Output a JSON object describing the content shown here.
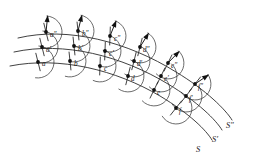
{
  "figure": {
    "background_color": "#ffffff",
    "ink_color": "#1c1c1c",
    "width": 256,
    "height": 160
  },
  "wavefronts": [
    {
      "id": "S",
      "label": "S",
      "label_pos": {
        "x": 196,
        "y": 152
      },
      "role": "primary-wavefront",
      "path": "M 10,66 C 60,56 116,70 160,96 C 190,114 206,130 212,140",
      "points": [
        {
          "label": "a",
          "x": 38,
          "y": 62,
          "lx": 42,
          "ly": 66,
          "tick_angle": 104,
          "arrow_angle": 6
        },
        {
          "label": "b",
          "x": 70,
          "y": 61,
          "lx": 74,
          "ly": 66,
          "tick_angle": 96,
          "arrow_angle": 14
        },
        {
          "label": "c",
          "x": 100,
          "y": 66,
          "lx": 104,
          "ly": 71,
          "tick_angle": 88,
          "arrow_angle": 22
        },
        {
          "label": "d",
          "x": 128,
          "y": 76,
          "lx": 131,
          "ly": 81,
          "tick_angle": 76,
          "arrow_angle": 32
        },
        {
          "label": "e",
          "x": 154,
          "y": 90,
          "lx": 157,
          "ly": 95,
          "tick_angle": 64,
          "arrow_angle": 44
        },
        {
          "label": "f",
          "x": 176,
          "y": 108,
          "lx": 179,
          "ly": 113,
          "tick_angle": 52,
          "arrow_angle": 56
        }
      ]
    },
    {
      "id": "S'",
      "label": "S′",
      "label_pos": {
        "x": 212,
        "y": 142
      },
      "role": "secondary-wavefront",
      "path": "M 14,52 C 64,41 122,56 168,84 C 198,102 216,120 222,130",
      "points": [
        {
          "label": "a′",
          "x": 42,
          "y": 47,
          "lx": 46,
          "ly": 52,
          "tick_angle": 104,
          "arrow_angle": 6
        },
        {
          "label": "b′",
          "x": 74,
          "y": 46,
          "lx": 78,
          "ly": 51,
          "tick_angle": 96,
          "arrow_angle": 14
        },
        {
          "label": "c′",
          "x": 105,
          "y": 51,
          "lx": 109,
          "ly": 56,
          "tick_angle": 88,
          "arrow_angle": 22
        },
        {
          "label": "d′",
          "x": 134,
          "y": 61,
          "lx": 137,
          "ly": 66,
          "tick_angle": 76,
          "arrow_angle": 32
        },
        {
          "label": "e′",
          "x": 161,
          "y": 76,
          "lx": 164,
          "ly": 81,
          "tick_angle": 64,
          "arrow_angle": 44
        },
        {
          "label": "f′",
          "x": 186,
          "y": 96,
          "lx": 189,
          "ly": 101,
          "tick_angle": 52,
          "arrow_angle": 56
        }
      ]
    },
    {
      "id": "S''",
      "label": "S″",
      "label_pos": {
        "x": 226,
        "y": 128
      },
      "role": "tertiary-wavefront",
      "path": "M 18,38 C 68,26 128,42 176,72 C 206,90 226,110 232,120",
      "points": [
        {
          "label": "a″",
          "x": 46,
          "y": 32,
          "lx": 50,
          "ly": 37,
          "tick_angle": 104,
          "arrow_angle": 6
        },
        {
          "label": "b″",
          "x": 78,
          "y": 31,
          "lx": 82,
          "ly": 36,
          "tick_angle": 96,
          "arrow_angle": 14
        },
        {
          "label": "c″",
          "x": 110,
          "y": 36,
          "lx": 114,
          "ly": 41,
          "tick_angle": 88,
          "arrow_angle": 22
        },
        {
          "label": "d″",
          "x": 140,
          "y": 47,
          "lx": 143,
          "ly": 52,
          "tick_angle": 76,
          "arrow_angle": 32
        },
        {
          "label": "e″",
          "x": 168,
          "y": 63,
          "lx": 171,
          "ly": 68,
          "tick_angle": 64,
          "arrow_angle": 44
        },
        {
          "label": "f″",
          "x": 195,
          "y": 84,
          "lx": 198,
          "ly": 89,
          "tick_angle": 52,
          "arrow_angle": 56
        }
      ]
    }
  ],
  "geometry": {
    "wavelet_radius": 16,
    "tick_half_length": 9,
    "arrow_length": 17,
    "arrow_head_length": 7,
    "arrow_head_width": 5,
    "node_radius": 1.9,
    "arc_sweep_degrees": 186
  }
}
